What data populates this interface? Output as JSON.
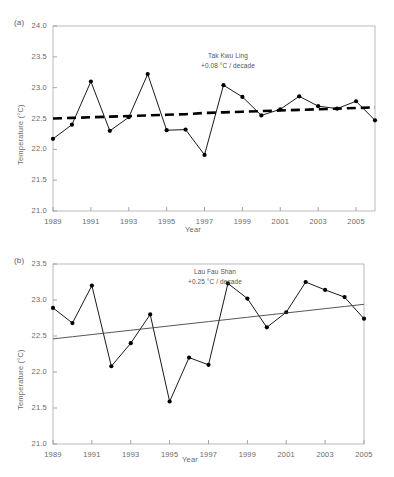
{
  "figure": {
    "panels": [
      {
        "key": "a",
        "label": "(a)",
        "annotation_line1": "Tak Kwu Ling",
        "annotation_line2": "+0.08 °C / decade",
        "xlabel": "Year",
        "ylabel": "Temperature (°C)",
        "yticks": [
          "24.0",
          "23.5",
          "23.0",
          "22.5",
          "22.0",
          "21.5",
          "21.0"
        ],
        "xticks": [
          "1989",
          "1991",
          "1993",
          "1995",
          "1997",
          "1999",
          "2001",
          "2003",
          "2005"
        ]
      },
      {
        "key": "b",
        "label": "(b)",
        "annotation_line1": "Lau Fau Shan",
        "annotation_line2": "+0.25 °C / decade",
        "xlabel": "Year",
        "ylabel": "Temperature (°C)",
        "yticks": [
          "23.5",
          "23.0",
          "22.5",
          "22.0",
          "21.5",
          "21.0"
        ],
        "xticks": [
          "1989",
          "1991",
          "1993",
          "1995",
          "1997",
          "1999",
          "2001",
          "2003",
          "2005"
        ]
      }
    ]
  },
  "chart_data": [
    {
      "type": "line",
      "title": "Tak Kwu Ling",
      "subtitle": "+0.08 °C / decade",
      "xlabel": "Year",
      "ylabel": "Temperature (°C)",
      "ylim": [
        21.0,
        24.0
      ],
      "xlim": [
        1989,
        2006
      ],
      "ytick_step": 0.5,
      "grid": false,
      "legend": "none",
      "x": [
        1989,
        1990,
        1991,
        1992,
        1993,
        1994,
        1995,
        1996,
        1997,
        1998,
        1999,
        2000,
        2001,
        2002,
        2003,
        2004,
        2005,
        2006
      ],
      "series": [
        {
          "name": "Annual mean temperature",
          "marker": "filled-circle",
          "line_style": "solid",
          "color": "#000000",
          "values": [
            22.17,
            22.4,
            23.1,
            22.3,
            22.52,
            23.22,
            22.31,
            22.32,
            21.91,
            23.04,
            22.85,
            22.55,
            22.65,
            22.86,
            22.7,
            22.66,
            22.78,
            22.47
          ]
        },
        {
          "name": "Linear trend",
          "marker": "none",
          "line_style": "dashed",
          "color": "#000000",
          "values": [
            22.5,
            22.51,
            22.52,
            22.53,
            22.54,
            22.55,
            22.56,
            22.57,
            22.59,
            22.6,
            22.61,
            22.62,
            22.63,
            22.64,
            22.65,
            22.66,
            22.67,
            22.68
          ]
        }
      ]
    },
    {
      "type": "line",
      "title": "Lau Fau Shan",
      "subtitle": "+0.25 °C / decade",
      "xlabel": "Year",
      "ylabel": "Temperature (°C)",
      "ylim": [
        21.0,
        23.5
      ],
      "xlim": [
        1989,
        2005
      ],
      "ytick_step": 0.5,
      "grid": false,
      "legend": "none",
      "x": [
        1989,
        1990,
        1991,
        1992,
        1993,
        1994,
        1995,
        1996,
        1997,
        1998,
        1999,
        2000,
        2001,
        2002,
        2003,
        2004,
        2005
      ],
      "series": [
        {
          "name": "Annual mean temperature",
          "marker": "filled-circle",
          "line_style": "solid",
          "color": "#000000",
          "values": [
            22.89,
            22.68,
            23.2,
            22.08,
            22.4,
            22.8,
            21.59,
            22.2,
            22.1,
            23.23,
            23.02,
            22.62,
            22.83,
            23.25,
            23.14,
            23.04,
            22.74
          ]
        },
        {
          "name": "Linear trend",
          "marker": "none",
          "line_style": "solid",
          "color": "#444444",
          "values": [
            22.46,
            22.49,
            22.52,
            22.55,
            22.58,
            22.61,
            22.64,
            22.67,
            22.7,
            22.73,
            22.76,
            22.79,
            22.82,
            22.85,
            22.88,
            22.91,
            22.94
          ]
        }
      ]
    }
  ]
}
